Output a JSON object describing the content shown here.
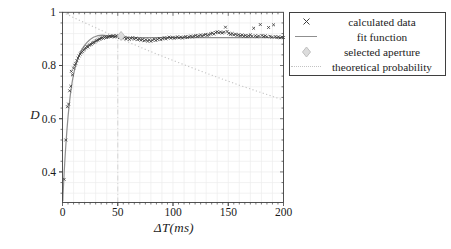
{
  "figure": {
    "background": "#ffffff"
  },
  "axes": {
    "x_label": "ΔT(ms)",
    "y_label": "D"
  },
  "legend": {
    "position": "top-right",
    "items": [
      {
        "label": "calculated data",
        "marker": "x-marker"
      },
      {
        "label": "fit function",
        "marker": "solid-line"
      },
      {
        "label": "selected aperture",
        "marker": "diamond-marker"
      },
      {
        "label": "theoretical probability",
        "marker": "dotted-line"
      }
    ]
  },
  "colors": {
    "data_marker": "#3d3d3d",
    "fit_line": "#8f8f8f",
    "aperture_fill": "#dcdcdc",
    "aperture_edge": "#c0c0c0",
    "theoretical_line": "#c3c3c3",
    "vline": "#d9d9d9",
    "grid": "#ececec",
    "frame": "#3f3f3f",
    "tick_text": "#1a1a1a"
  },
  "chart_data": {
    "type": "scatter",
    "title": "",
    "xlabel": "ΔT(ms)",
    "ylabel": "D",
    "xlim": [
      0,
      200
    ],
    "ylim": [
      0.285,
      1.0
    ],
    "x_major_ticks": [
      0,
      50,
      100,
      150,
      200
    ],
    "x_tick_labels": [
      "0",
      "50",
      "100",
      "150",
      "200"
    ],
    "x_minor_step": 5,
    "y_major_ticks": [
      0.4,
      0.6,
      0.8,
      1.0
    ],
    "y_tick_labels": [
      "0.4",
      "0.6",
      "0.8",
      "1"
    ],
    "y_minor_step": 0.04,
    "grid": true,
    "grid_x_step": 10,
    "grid_y_step": 0.04,
    "legend_position": "outside top-right",
    "annotations": [
      {
        "type": "vline",
        "x": 50,
        "y0": 0.285,
        "y1": 0.92,
        "style": "dashdot"
      }
    ],
    "series": [
      {
        "name": "calculated data",
        "type": "scatter",
        "marker": "x",
        "points": [
          [
            1.5,
            0.372
          ],
          [
            3,
            0.52
          ],
          [
            4.5,
            0.645
          ],
          [
            5.5,
            0.655
          ],
          [
            6.5,
            0.705
          ],
          [
            7.5,
            0.722
          ],
          [
            8,
            0.778
          ],
          [
            9,
            0.765
          ],
          [
            10,
            0.79
          ],
          [
            11,
            0.801
          ],
          [
            12,
            0.808
          ],
          [
            13,
            0.818
          ],
          [
            14,
            0.828
          ],
          [
            15,
            0.836
          ],
          [
            16,
            0.843
          ],
          [
            17,
            0.848
          ],
          [
            18,
            0.852
          ],
          [
            19,
            0.858
          ],
          [
            20,
            0.862
          ],
          [
            21,
            0.866
          ],
          [
            22,
            0.872
          ],
          [
            23,
            0.869
          ],
          [
            24,
            0.876
          ],
          [
            25,
            0.878
          ],
          [
            26,
            0.88
          ],
          [
            27,
            0.884
          ],
          [
            28,
            0.886
          ],
          [
            29,
            0.888
          ],
          [
            30,
            0.892
          ],
          [
            31,
            0.894
          ],
          [
            32,
            0.896
          ],
          [
            33,
            0.899
          ],
          [
            34,
            0.9
          ],
          [
            35,
            0.903
          ],
          [
            36,
            0.905
          ],
          [
            37,
            0.902
          ],
          [
            38,
            0.906
          ],
          [
            39,
            0.908
          ],
          [
            40,
            0.905
          ],
          [
            41,
            0.907
          ],
          [
            42,
            0.909
          ],
          [
            43,
            0.911
          ],
          [
            44,
            0.908
          ],
          [
            45,
            0.91
          ],
          [
            46,
            0.912
          ],
          [
            47,
            0.907
          ],
          [
            48,
            0.91
          ],
          [
            49,
            0.912
          ],
          [
            50,
            0.91
          ],
          [
            51.5,
            0.905
          ],
          [
            53,
            0.908
          ],
          [
            54.5,
            0.903
          ],
          [
            56,
            0.906
          ],
          [
            57.5,
            0.9
          ],
          [
            59,
            0.904
          ],
          [
            60.5,
            0.898
          ],
          [
            62,
            0.902
          ],
          [
            63.5,
            0.905
          ],
          [
            65,
            0.899
          ],
          [
            66.5,
            0.903
          ],
          [
            68,
            0.897
          ],
          [
            69.5,
            0.9
          ],
          [
            71,
            0.895
          ],
          [
            72.5,
            0.898
          ],
          [
            74,
            0.893
          ],
          [
            75.5,
            0.897
          ],
          [
            77,
            0.892
          ],
          [
            78.5,
            0.896
          ],
          [
            80,
            0.891
          ],
          [
            81.5,
            0.895
          ],
          [
            83,
            0.899
          ],
          [
            84.5,
            0.894
          ],
          [
            86,
            0.898
          ],
          [
            87.5,
            0.902
          ],
          [
            89,
            0.897
          ],
          [
            90.5,
            0.901
          ],
          [
            92,
            0.905
          ],
          [
            93.5,
            0.9
          ],
          [
            95,
            0.904
          ],
          [
            96.5,
            0.907
          ],
          [
            98,
            0.903
          ],
          [
            99.5,
            0.906
          ],
          [
            101,
            0.902
          ],
          [
            102.5,
            0.905
          ],
          [
            104,
            0.908
          ],
          [
            105.5,
            0.904
          ],
          [
            107,
            0.907
          ],
          [
            108.5,
            0.903
          ],
          [
            110,
            0.906
          ],
          [
            111.5,
            0.909
          ],
          [
            113,
            0.905
          ],
          [
            114.5,
            0.908
          ],
          [
            116,
            0.911
          ],
          [
            117.5,
            0.907
          ],
          [
            119,
            0.91
          ],
          [
            120.5,
            0.913
          ],
          [
            122,
            0.909
          ],
          [
            123.5,
            0.912
          ],
          [
            125,
            0.915
          ],
          [
            126.5,
            0.911
          ],
          [
            128,
            0.914
          ],
          [
            129.5,
            0.917
          ],
          [
            131,
            0.913
          ],
          [
            132.5,
            0.916
          ],
          [
            134,
            0.919
          ],
          [
            135.5,
            0.922
          ],
          [
            137,
            0.918
          ],
          [
            138.5,
            0.924
          ],
          [
            140,
            0.927
          ],
          [
            141.5,
            0.923
          ],
          [
            143,
            0.926
          ],
          [
            144.5,
            0.922
          ],
          [
            146,
            0.925
          ],
          [
            147.5,
            0.944
          ],
          [
            149,
            0.928
          ],
          [
            150.5,
            0.921
          ],
          [
            152,
            0.917
          ],
          [
            153.5,
            0.92
          ],
          [
            155,
            0.915
          ],
          [
            156.5,
            0.918
          ],
          [
            158,
            0.913
          ],
          [
            159.5,
            0.916
          ],
          [
            161,
            0.912
          ],
          [
            162.5,
            0.915
          ],
          [
            164,
            0.91
          ],
          [
            165.5,
            0.913
          ],
          [
            167,
            0.909
          ],
          [
            168.5,
            0.912
          ],
          [
            170,
            0.915
          ],
          [
            171.5,
            0.91
          ],
          [
            173,
            0.94
          ],
          [
            174.5,
            0.912
          ],
          [
            176,
            0.908
          ],
          [
            177.5,
            0.911
          ],
          [
            179,
            0.954
          ],
          [
            180.5,
            0.913
          ],
          [
            182,
            0.909
          ],
          [
            183.5,
            0.912
          ],
          [
            185,
            0.908
          ],
          [
            186.5,
            0.943
          ],
          [
            188,
            0.91
          ],
          [
            189.5,
            0.906
          ],
          [
            191,
            0.953
          ],
          [
            192.5,
            0.909
          ],
          [
            194,
            0.905
          ],
          [
            195.5,
            0.908
          ],
          [
            197,
            0.904
          ],
          [
            198.5,
            0.907
          ],
          [
            200,
            0.905
          ]
        ]
      },
      {
        "name": "fit function",
        "type": "line",
        "style": "solid",
        "points": [
          [
            0.3,
            0.29
          ],
          [
            0.5,
            0.315
          ],
          [
            1,
            0.357
          ],
          [
            1.5,
            0.396
          ],
          [
            2,
            0.433
          ],
          [
            2.5,
            0.467
          ],
          [
            3,
            0.499
          ],
          [
            4,
            0.557
          ],
          [
            5,
            0.607
          ],
          [
            6,
            0.65
          ],
          [
            7,
            0.687
          ],
          [
            8,
            0.718
          ],
          [
            9,
            0.744
          ],
          [
            10,
            0.766
          ],
          [
            11,
            0.785
          ],
          [
            12,
            0.801
          ],
          [
            13,
            0.815
          ],
          [
            14,
            0.827
          ],
          [
            15,
            0.838
          ],
          [
            16,
            0.848
          ],
          [
            17,
            0.856
          ],
          [
            18,
            0.864
          ],
          [
            19,
            0.87
          ],
          [
            20,
            0.876
          ],
          [
            22,
            0.886
          ],
          [
            24,
            0.894
          ],
          [
            26,
            0.901
          ],
          [
            28,
            0.906
          ],
          [
            30,
            0.909
          ],
          [
            32,
            0.912
          ],
          [
            34,
            0.913
          ],
          [
            36,
            0.914
          ],
          [
            38,
            0.913
          ],
          [
            40,
            0.912
          ],
          [
            43,
            0.911
          ],
          [
            46,
            0.91
          ],
          [
            50,
            0.908
          ],
          [
            55,
            0.907
          ],
          [
            60,
            0.906
          ],
          [
            70,
            0.905
          ],
          [
            80,
            0.905
          ],
          [
            100,
            0.905
          ],
          [
            120,
            0.905
          ],
          [
            140,
            0.905
          ],
          [
            160,
            0.905
          ],
          [
            180,
            0.905
          ],
          [
            200,
            0.905
          ]
        ]
      },
      {
        "name": "selected aperture",
        "type": "marker",
        "marker": "diamond",
        "points": [
          [
            53,
            0.911
          ]
        ]
      },
      {
        "name": "theoretical probability",
        "type": "line",
        "style": "dotted",
        "points": [
          [
            0,
            1.0
          ],
          [
            20,
            0.961
          ],
          [
            40,
            0.923
          ],
          [
            60,
            0.887
          ],
          [
            80,
            0.852
          ],
          [
            100,
            0.819
          ],
          [
            120,
            0.787
          ],
          [
            140,
            0.756
          ],
          [
            160,
            0.726
          ],
          [
            180,
            0.698
          ],
          [
            200,
            0.67
          ]
        ]
      }
    ]
  }
}
